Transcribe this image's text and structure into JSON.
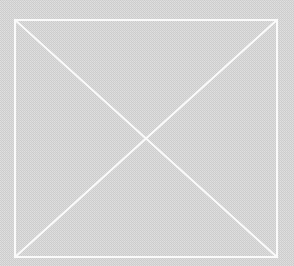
{
  "image": {
    "kind": "broken-image-placeholder",
    "alt_text": "",
    "width": 294,
    "height": 266,
    "background_color": "#cacaca",
    "stroke_color": "#fafafa",
    "stroke_width": 2,
    "texture": "fine-dither-checker",
    "frame": {
      "x": 15,
      "y": 20,
      "width": 262,
      "height": 237,
      "right": 277,
      "bottom": 257,
      "center_x": 146,
      "center_y": 138
    },
    "diagonals": [
      {
        "name": "diagonal-top-left-to-bottom-right",
        "x1": 15,
        "y1": 20,
        "x2": 277,
        "y2": 257
      },
      {
        "name": "diagonal-bottom-left-to-top-right",
        "x1": 15,
        "y1": 257,
        "x2": 277,
        "y2": 20
      }
    ]
  }
}
